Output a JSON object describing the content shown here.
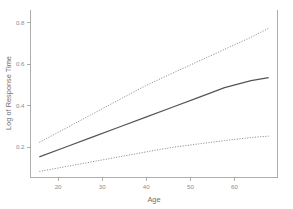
{
  "chart_data": {
    "type": "line",
    "title": "",
    "subtitle": "",
    "xlabel": "Age",
    "ylabel": "Log of Response Time",
    "xlim": [
      16,
      72
    ],
    "ylim": [
      0.05,
      0.88
    ],
    "xticks": [
      20,
      30,
      40,
      50,
      60
    ],
    "yticks": [
      0.2,
      0.4,
      0.6,
      0.8
    ],
    "xtick_labels": [
      "20",
      "30",
      "40",
      "50",
      "60"
    ],
    "ytick_labels": [
      "0.2",
      "0.4",
      "0.6",
      "0.8"
    ],
    "grid": false,
    "legend": "none",
    "annotations": [],
    "series": [
      {
        "name": "Fitted regression line",
        "style": "solid",
        "color": "#555555",
        "x": [
          18,
          24,
          30,
          36,
          42,
          48,
          54,
          60,
          66,
          70
        ],
        "values": [
          0.152,
          0.201,
          0.25,
          0.299,
          0.348,
          0.397,
          0.446,
          0.495,
          0.53,
          0.545
        ]
      },
      {
        "name": "Upper confidence band",
        "style": "dotted",
        "color": "#777777",
        "x": [
          18,
          24,
          30,
          36,
          42,
          48,
          54,
          60,
          66,
          70
        ],
        "values": [
          0.224,
          0.294,
          0.364,
          0.434,
          0.504,
          0.565,
          0.625,
          0.685,
          0.745,
          0.79
        ]
      },
      {
        "name": "Lower confidence band",
        "style": "dotted",
        "color": "#777777",
        "x": [
          18,
          24,
          30,
          36,
          42,
          48,
          54,
          60,
          66,
          70
        ],
        "values": [
          0.08,
          0.104,
          0.128,
          0.152,
          0.176,
          0.199,
          0.216,
          0.233,
          0.248,
          0.255
        ]
      }
    ]
  },
  "axes": {
    "x_title": "Age",
    "y_title": "Log of Response Time",
    "x_tick_0": "20",
    "x_tick_1": "30",
    "x_tick_2": "40",
    "x_tick_3": "50",
    "x_tick_4": "60",
    "y_tick_0": "0.2",
    "y_tick_1": "0.4",
    "y_tick_2": "0.6",
    "y_tick_3": "0.8"
  },
  "colors": {
    "background": "#ffffff",
    "axis": "#9a9a9a",
    "tick_text": "#8e8e8e",
    "title_text": "#6f6f6f",
    "fit_line": "#555555",
    "band_line": "#777777"
  }
}
